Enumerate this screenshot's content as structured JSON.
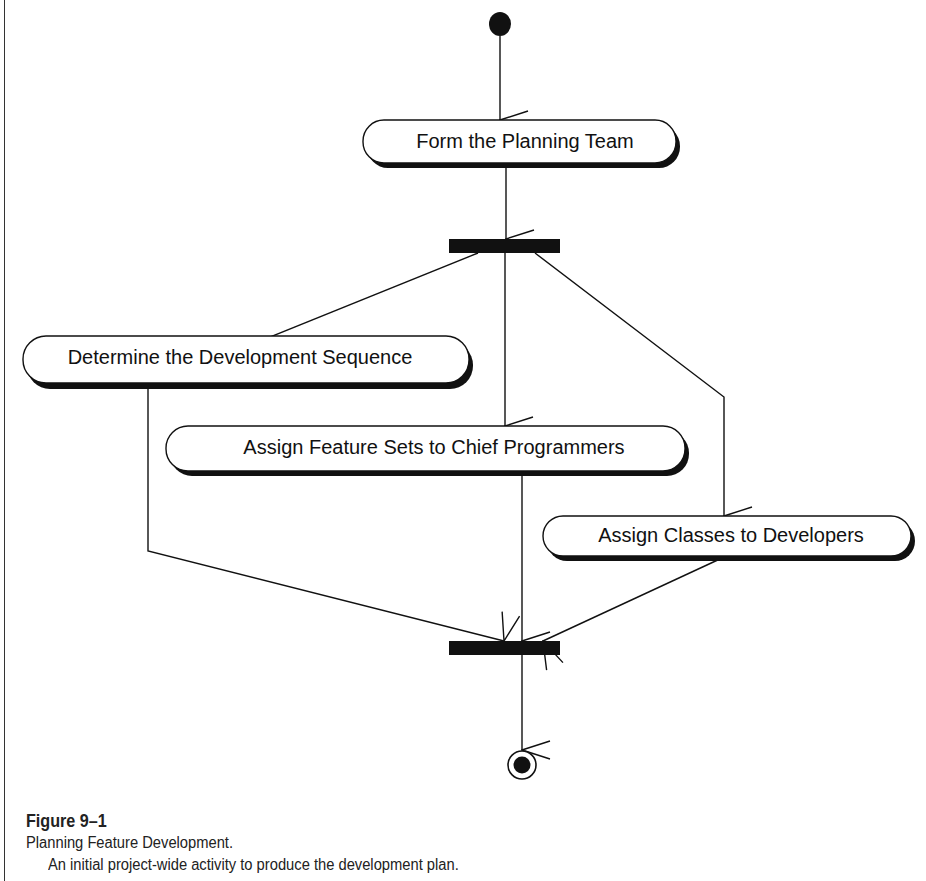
{
  "diagram": {
    "type": "uml-activity",
    "nodes": {
      "initial": {
        "label": "initial-node"
      },
      "form_team": {
        "label": "Form the Planning Team"
      },
      "fork": {
        "label": "fork-bar"
      },
      "determine_sequence": {
        "label": "Determine the Development Sequence"
      },
      "assign_feature_sets": {
        "label": "Assign Feature Sets to Chief Programmers"
      },
      "assign_classes": {
        "label": "Assign Classes to Developers"
      },
      "join": {
        "label": "join-bar"
      },
      "final": {
        "label": "final-node"
      }
    },
    "edges": [
      {
        "from": "initial",
        "to": "form_team"
      },
      {
        "from": "form_team",
        "to": "fork"
      },
      {
        "from": "fork",
        "to": "determine_sequence"
      },
      {
        "from": "fork",
        "to": "assign_feature_sets"
      },
      {
        "from": "fork",
        "to": "assign_classes"
      },
      {
        "from": "determine_sequence",
        "to": "join"
      },
      {
        "from": "assign_feature_sets",
        "to": "join"
      },
      {
        "from": "assign_classes",
        "to": "join"
      },
      {
        "from": "join",
        "to": "final"
      }
    ]
  },
  "caption": {
    "title": "Figure 9–1",
    "subtitle": "Planning Feature Development.",
    "body": "An initial project-wide activity to produce the development plan."
  }
}
